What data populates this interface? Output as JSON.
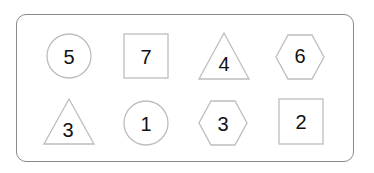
{
  "diagram": {
    "frame": {
      "border_color": "#8a8a8a",
      "shape_stroke_color": "#bdbdbd",
      "text_color": "#111111"
    },
    "rows": [
      {
        "items": [
          {
            "shape": "circle",
            "label": "5"
          },
          {
            "shape": "square",
            "label": "7"
          },
          {
            "shape": "triangle",
            "label": "4"
          },
          {
            "shape": "hexagon",
            "label": "6"
          }
        ]
      },
      {
        "items": [
          {
            "shape": "triangle",
            "label": "3"
          },
          {
            "shape": "circle",
            "label": "1"
          },
          {
            "shape": "hexagon",
            "label": "3"
          },
          {
            "shape": "square",
            "label": "2"
          }
        ]
      }
    ]
  }
}
